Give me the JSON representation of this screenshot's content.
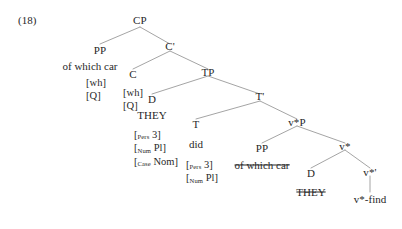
{
  "figure": {
    "number": "(18)",
    "type": "syntactic-tree-diagram"
  },
  "nodes": {
    "cp": "CP",
    "pp_spec": "PP",
    "cbar": "C'",
    "c": "C",
    "tp": "TP",
    "d_spec": "D",
    "tbar": "T'",
    "t": "T",
    "vstarp": "v*P",
    "pp_obj": "PP",
    "vstar": "v*",
    "d_obj": "D",
    "vstarbar": "v*'",
    "vstar_find": "v*-find"
  },
  "terminals": {
    "of_which_car_top": "of which car",
    "they_subject": "THEY",
    "did": "did",
    "of_which_car_trace": "of which car",
    "they_trace": "THEY",
    "vstar_find": "v*-find"
  },
  "features": {
    "pp_spec": [
      "[wh]",
      "[Q]"
    ],
    "c": [
      "[wh]",
      "[Q]"
    ],
    "d_subject": [
      {
        "sub": "Pers",
        "value": "3"
      },
      {
        "sub": "Num",
        "value": "Pl"
      },
      {
        "sub": "Case",
        "value": "Nom"
      }
    ],
    "t": [
      {
        "sub": "Pers",
        "value": "3"
      },
      {
        "sub": "Num",
        "value": "Pl"
      }
    ]
  },
  "colors": {
    "text": "#272727",
    "line": "#9a9a9a",
    "background": "#ffffff"
  },
  "edges": [
    {
      "from": "cp",
      "to": "pp_spec"
    },
    {
      "from": "cp",
      "to": "cbar"
    },
    {
      "from": "cbar",
      "to": "c"
    },
    {
      "from": "cbar",
      "to": "tp"
    },
    {
      "from": "tp",
      "to": "d_spec"
    },
    {
      "from": "tp",
      "to": "tbar"
    },
    {
      "from": "tbar",
      "to": "t"
    },
    {
      "from": "tbar",
      "to": "vstarp"
    },
    {
      "from": "vstarp",
      "to": "pp_obj"
    },
    {
      "from": "vstarp",
      "to": "vstar"
    },
    {
      "from": "vstar",
      "to": "d_obj"
    },
    {
      "from": "vstar",
      "to": "vstarbar"
    },
    {
      "from": "vstarbar",
      "to": "vstar_find"
    }
  ]
}
